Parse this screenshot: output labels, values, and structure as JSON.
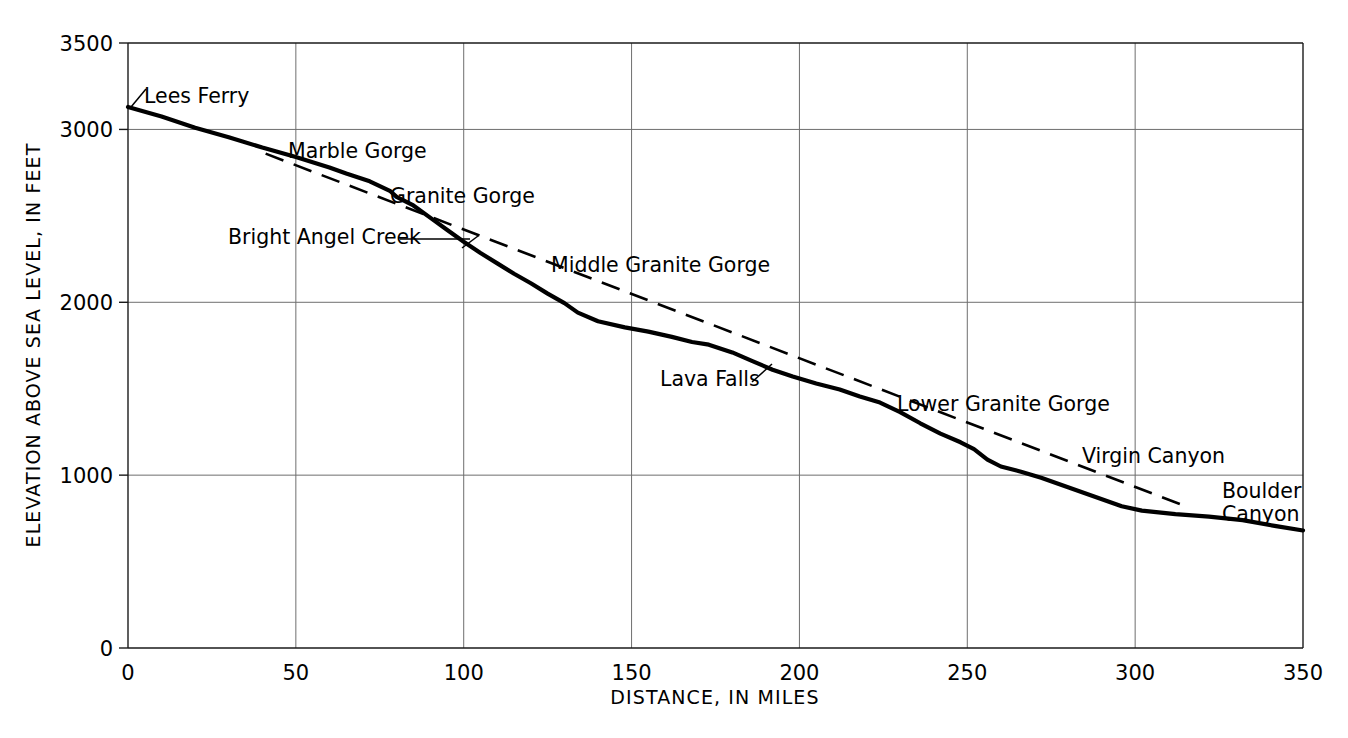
{
  "chart_data": {
    "type": "line",
    "title": "",
    "xlabel": "DISTANCE, IN  MILES",
    "ylabel": "ELEVATION ABOVE SEA LEVEL, IN FEET",
    "xlim": [
      0,
      350
    ],
    "ylim": [
      0,
      3500
    ],
    "xticks": [
      0,
      50,
      100,
      150,
      200,
      250,
      300,
      350
    ],
    "xtick_labels": [
      "0",
      "50",
      "100",
      "150",
      "200",
      "250",
      "300",
      "350"
    ],
    "yticks": [
      0,
      1000,
      2000,
      3000,
      3500
    ],
    "ytick_labels": [
      "0",
      "1000",
      "2000",
      "3000",
      "3500"
    ],
    "grid": true,
    "legend": "none",
    "series": [
      {
        "name": "River profile",
        "style": "solid",
        "points": [
          [
            0,
            3130
          ],
          [
            10,
            3075
          ],
          [
            20,
            3010
          ],
          [
            30,
            2955
          ],
          [
            40,
            2895
          ],
          [
            50,
            2840
          ],
          [
            60,
            2780
          ],
          [
            65,
            2745
          ],
          [
            72,
            2700
          ],
          [
            78,
            2645
          ],
          [
            80,
            2610
          ],
          [
            85,
            2560
          ],
          [
            90,
            2490
          ],
          [
            95,
            2420
          ],
          [
            100,
            2350
          ],
          [
            105,
            2285
          ],
          [
            110,
            2225
          ],
          [
            115,
            2165
          ],
          [
            120,
            2110
          ],
          [
            125,
            2050
          ],
          [
            130,
            1995
          ],
          [
            134,
            1940
          ],
          [
            140,
            1890
          ],
          [
            148,
            1855
          ],
          [
            155,
            1830
          ],
          [
            162,
            1800
          ],
          [
            168,
            1770
          ],
          [
            173,
            1755
          ],
          [
            180,
            1710
          ],
          [
            186,
            1660
          ],
          [
            192,
            1610
          ],
          [
            198,
            1570
          ],
          [
            205,
            1530
          ],
          [
            212,
            1495
          ],
          [
            218,
            1455
          ],
          [
            224,
            1420
          ],
          [
            230,
            1365
          ],
          [
            236,
            1300
          ],
          [
            242,
            1240
          ],
          [
            248,
            1190
          ],
          [
            252,
            1150
          ],
          [
            256,
            1090
          ],
          [
            260,
            1050
          ],
          [
            266,
            1020
          ],
          [
            272,
            985
          ],
          [
            280,
            930
          ],
          [
            288,
            875
          ],
          [
            296,
            820
          ],
          [
            302,
            795
          ],
          [
            312,
            775
          ],
          [
            322,
            760
          ],
          [
            332,
            740
          ],
          [
            342,
            705
          ],
          [
            350,
            680
          ]
        ]
      },
      {
        "name": "Reference gradient",
        "style": "dashed",
        "points": [
          [
            41,
            2860
          ],
          [
            350,
            560
          ]
        ],
        "dash_visible_range": [
          41,
          316
        ]
      }
    ],
    "annotations": [
      {
        "id": "lees-ferry",
        "label": "Lees Ferry",
        "text_x": 144,
        "text_y": 103,
        "leader": [
          [
            131,
            107
          ],
          [
            146,
            89
          ]
        ],
        "anchor": "start",
        "lines": 1
      },
      {
        "id": "marble-gorge",
        "label": "Marble Gorge",
        "text_x": 288,
        "text_y": 158,
        "leader": null,
        "anchor": "start",
        "lines": 1
      },
      {
        "id": "granite-gorge",
        "label": "Granite Gorge",
        "text_x": 390,
        "text_y": 203,
        "leader": null,
        "anchor": "start",
        "lines": 1
      },
      {
        "id": "bright-angel-creek",
        "label": "Bright Angel Creek",
        "text_x": 228,
        "text_y": 244,
        "leader": [
          [
            400,
            239
          ],
          [
            470,
            239
          ]
        ],
        "leader2": [
          [
            462,
            248
          ],
          [
            478,
            236
          ]
        ],
        "anchor": "start",
        "lines": 1
      },
      {
        "id": "middle-granite-gorge",
        "label": "Middle Granite Gorge",
        "text_x": 551,
        "text_y": 272,
        "leader": null,
        "anchor": "start",
        "lines": 1
      },
      {
        "id": "lava-falls",
        "label": "Lava Falls",
        "text_x": 660,
        "text_y": 386,
        "leader": [
          [
            752,
            382
          ],
          [
            772,
            364
          ]
        ],
        "anchor": "start",
        "lines": 1
      },
      {
        "id": "lower-granite-gorge",
        "label": "Lower Granite Gorge",
        "text_x": 897,
        "text_y": 411,
        "leader": null,
        "anchor": "start",
        "lines": 1
      },
      {
        "id": "virgin-canyon",
        "label": "Virgin Canyon",
        "text_x": 1082,
        "text_y": 463,
        "leader": null,
        "anchor": "start",
        "lines": 1
      },
      {
        "id": "boulder-canyon",
        "label": "Boulder",
        "label2": "Canyon",
        "text_x": 1222,
        "text_y": 498,
        "text_y2": 521,
        "leader": null,
        "anchor": "start",
        "lines": 2
      }
    ]
  },
  "colors": {
    "line": "#000000",
    "grid": "#6e6e6e",
    "axis": "#1a1a1a",
    "background": "#ffffff"
  },
  "geometry": {
    "plot_left": 128,
    "plot_right": 1303,
    "plot_top": 43,
    "plot_bottom": 648
  }
}
